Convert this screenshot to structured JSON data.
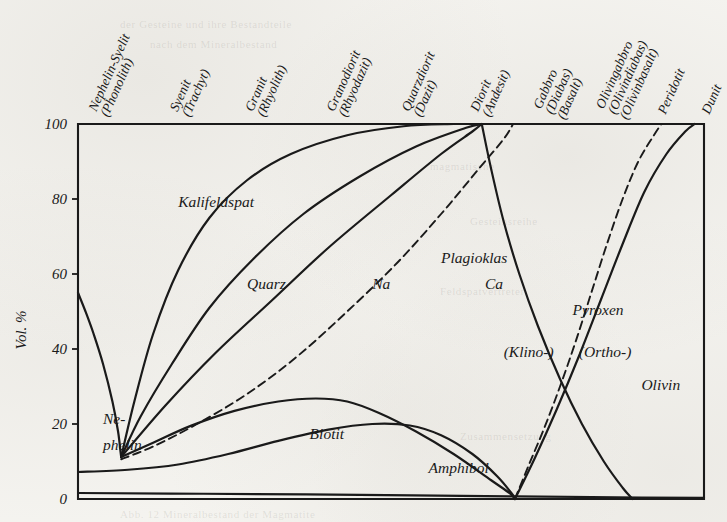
{
  "figure": {
    "kind": "mineral-composition-diagram",
    "y_axis_label": "Vol. %",
    "ink_color": "#1a1a1a",
    "paper_color": "#f5f4f0"
  },
  "chart_data": {
    "type": "area",
    "title": "",
    "subtitle": "",
    "xlabel": "",
    "ylabel": "Vol. %",
    "ylim": [
      0,
      100
    ],
    "xlim": [
      0,
      100
    ],
    "grid": false,
    "legend_position": "inline-labels",
    "y_ticks": [
      0,
      20,
      40,
      60,
      80,
      100
    ],
    "y_tick_labels": [
      "0",
      "20",
      "40",
      "60",
      "80",
      "100"
    ],
    "x_tick_labels": [
      "Nephelin-Syenit\n(Phonolith)",
      "Syenit\n(Trachyt)",
      "Granit\n(Rhyolith)",
      "Granodiorit\n(Rhyodazit)",
      "Quarzdiorit\n(Dazit)",
      "Diorit\n(Andesit)",
      "Gabbro\n(Diabas)\n(Basalt)",
      "Olivingabbro\n(Olivindiabas)\n(Olivinbasalt)",
      "Peridotit",
      "Dunit"
    ],
    "x_columns": [
      {
        "id": "nephelin-syenit",
        "lines": [
          "Nephelin-Syelit",
          "(Phonolith)"
        ],
        "x_pct": 3
      },
      {
        "id": "syenit",
        "lines": [
          "Syenit",
          "(Trachyt)"
        ],
        "x_pct": 16
      },
      {
        "id": "granit",
        "lines": [
          "Granit",
          "(Rhyolith)"
        ],
        "x_pct": 28
      },
      {
        "id": "granodiorit",
        "lines": [
          "Granodiorit",
          "(Rhyodazit)"
        ],
        "x_pct": 41
      },
      {
        "id": "quarzdiorit",
        "lines": [
          "Quarzdiorit",
          "(Dazit)"
        ],
        "x_pct": 53
      },
      {
        "id": "diorit",
        "lines": [
          "Diorit",
          "(Andesit)"
        ],
        "x_pct": 64
      },
      {
        "id": "gabbro",
        "lines": [
          "Gabbro",
          "(Diabas)",
          "(Basalt)"
        ],
        "x_pct": 75
      },
      {
        "id": "olivingabbro",
        "lines": [
          "Olivingabbro",
          "(Olivindiabas)",
          "(Olivinbasalt)"
        ],
        "x_pct": 85
      },
      {
        "id": "peridotit",
        "lines": [
          "Peridotit"
        ],
        "x_pct": 93
      },
      {
        "id": "dunit",
        "lines": [
          "Dunit"
        ],
        "x_pct": 100
      }
    ],
    "field_labels": [
      {
        "id": "kalifeldspat",
        "text": "Kalifeldspat",
        "x_pct": 16,
        "y_pct": 78
      },
      {
        "id": "quarz",
        "text": "Quarz",
        "x_pct": 27,
        "y_pct": 56
      },
      {
        "id": "na",
        "text": "Na",
        "x_pct": 47,
        "y_pct": 56
      },
      {
        "id": "plagioklas",
        "text": "Plagioklas",
        "x_pct": 58,
        "y_pct": 63
      },
      {
        "id": "ca",
        "text": "Ca",
        "x_pct": 65,
        "y_pct": 56
      },
      {
        "id": "pyroxen",
        "text": "Pyroxen",
        "x_pct": 79,
        "y_pct": 49
      },
      {
        "id": "klino",
        "text": "(Klino-)",
        "x_pct": 68,
        "y_pct": 38
      },
      {
        "id": "ortho",
        "text": "(Ortho-)",
        "x_pct": 80,
        "y_pct": 38
      },
      {
        "id": "olivin",
        "text": "Olivin",
        "x_pct": 90,
        "y_pct": 29
      },
      {
        "id": "nephelin-1",
        "text": "Ne-",
        "x_pct": 4,
        "y_pct": 20
      },
      {
        "id": "nephelin-2",
        "text": "phelin",
        "x_pct": 4,
        "y_pct": 13
      },
      {
        "id": "biotit",
        "text": "Biotit",
        "x_pct": 37,
        "y_pct": 16
      },
      {
        "id": "amphibol",
        "text": "Amphibol",
        "x_pct": 56,
        "y_pct": 7
      }
    ],
    "series": [
      {
        "name": "Nephelin upper boundary",
        "style": "solid",
        "points": [
          [
            0,
            55
          ],
          [
            1.2,
            50
          ],
          [
            2.5,
            44
          ],
          [
            4,
            36
          ],
          [
            5.5,
            26
          ],
          [
            6.4,
            18
          ],
          [
            6.8,
            12.5
          ],
          [
            6.9,
            11.2
          ]
        ]
      },
      {
        "name": "Kalifeldspat / Quarz boundary",
        "style": "solid",
        "points": [
          [
            6.9,
            11.2
          ],
          [
            9,
            26
          ],
          [
            12,
            44
          ],
          [
            16,
            61
          ],
          [
            21,
            75
          ],
          [
            27,
            85
          ],
          [
            34,
            92
          ],
          [
            43,
            97
          ],
          [
            52,
            99.4
          ],
          [
            60,
            100
          ]
        ]
      },
      {
        "name": "Quarz / Plagioklas-Na boundary",
        "style": "solid",
        "points": [
          [
            6.9,
            11.2
          ],
          [
            10,
            22
          ],
          [
            15,
            36
          ],
          [
            21,
            51
          ],
          [
            28,
            64
          ],
          [
            36,
            76
          ],
          [
            45,
            86
          ],
          [
            54,
            94
          ],
          [
            62,
            99
          ],
          [
            64.5,
            100
          ]
        ]
      },
      {
        "name": "Plagioklas upper boundary (mafic top)",
        "style": "solid",
        "points": [
          [
            6.9,
            11.2
          ],
          [
            14,
            25
          ],
          [
            22,
            39
          ],
          [
            31,
            53
          ],
          [
            40,
            67
          ],
          [
            50,
            81
          ],
          [
            58,
            92
          ],
          [
            63,
            98
          ],
          [
            64.5,
            100
          ]
        ]
      },
      {
        "name": "Na / Ca plagioclase divide",
        "style": "dashed",
        "points": [
          [
            6.9,
            10.6
          ],
          [
            12,
            14
          ],
          [
            19,
            20
          ],
          [
            27,
            28
          ],
          [
            35,
            38
          ],
          [
            43,
            50
          ],
          [
            51,
            63
          ],
          [
            58,
            76
          ],
          [
            64,
            88
          ],
          [
            68,
            96
          ],
          [
            69.5,
            100
          ]
        ]
      },
      {
        "name": "Biotit upper boundary",
        "style": "solid",
        "points": [
          [
            6.9,
            11.2
          ],
          [
            12,
            15
          ],
          [
            18,
            19.5
          ],
          [
            25,
            23.5
          ],
          [
            32,
            26
          ],
          [
            38,
            26.8
          ],
          [
            43,
            26
          ],
          [
            48,
            23
          ],
          [
            54,
            18
          ],
          [
            60,
            12
          ],
          [
            66,
            5
          ],
          [
            69,
            1.5
          ],
          [
            69.8,
            0
          ]
        ]
      },
      {
        "name": "Amphibol upper boundary",
        "style": "solid",
        "points": [
          [
            0,
            7.2
          ],
          [
            8,
            7.8
          ],
          [
            16,
            9.2
          ],
          [
            24,
            12
          ],
          [
            32,
            15.5
          ],
          [
            40,
            18.5
          ],
          [
            47,
            20
          ],
          [
            53,
            19.6
          ],
          [
            58,
            17
          ],
          [
            63,
            12
          ],
          [
            67,
            6
          ],
          [
            69.5,
            1
          ],
          [
            69.8,
            0
          ]
        ]
      },
      {
        "name": "Lower accessory band",
        "style": "solid",
        "points": [
          [
            0,
            1.6
          ],
          [
            20,
            1.4
          ],
          [
            45,
            1.1
          ],
          [
            70,
            0.7
          ],
          [
            90,
            0.4
          ],
          [
            100,
            0.3
          ]
        ]
      },
      {
        "name": "Pyroxen (Klino-) boundary",
        "style": "solid",
        "points": [
          [
            64.5,
            100
          ],
          [
            66,
            88
          ],
          [
            68,
            74
          ],
          [
            70.5,
            60
          ],
          [
            73.5,
            46
          ],
          [
            77,
            32
          ],
          [
            80.5,
            20
          ],
          [
            84,
            10
          ],
          [
            87,
            3
          ],
          [
            88.6,
            0
          ]
        ]
      },
      {
        "name": "Klino- / Ortho-pyroxene divide",
        "style": "dashed",
        "points": [
          [
            69.8,
            0
          ],
          [
            72,
            9
          ],
          [
            74.5,
            19
          ],
          [
            77,
            30
          ],
          [
            79.5,
            42
          ],
          [
            82,
            55
          ],
          [
            84.5,
            68
          ],
          [
            87,
            80
          ],
          [
            89.5,
            90
          ],
          [
            92,
            97
          ],
          [
            93.2,
            100
          ]
        ]
      },
      {
        "name": "Pyroxen / Olivin boundary",
        "style": "solid",
        "points": [
          [
            69.8,
            0
          ],
          [
            73,
            11
          ],
          [
            76.5,
            24
          ],
          [
            80,
            38
          ],
          [
            83.5,
            53
          ],
          [
            87,
            68
          ],
          [
            90.5,
            82
          ],
          [
            94,
            92
          ],
          [
            97,
            98
          ],
          [
            98.5,
            100
          ]
        ]
      }
    ]
  }
}
